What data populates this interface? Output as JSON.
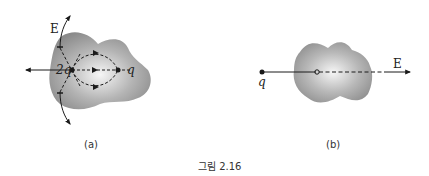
{
  "figure": {
    "caption": "그림 2.16",
    "panels": [
      {
        "id": "a",
        "label": "(a)",
        "charges": [
          {
            "name": "2q-charge",
            "label": "2q"
          },
          {
            "name": "q-charge",
            "label": "q"
          }
        ],
        "field_label": "E"
      },
      {
        "id": "b",
        "label": "(b)",
        "charges": [
          {
            "name": "q-charge",
            "label": "q"
          }
        ],
        "field_label": "E"
      }
    ]
  },
  "colors": {
    "blob_outer": "#8a8a8a",
    "blob_inner": "#f4f4f4",
    "line": "#1a1a1a"
  }
}
